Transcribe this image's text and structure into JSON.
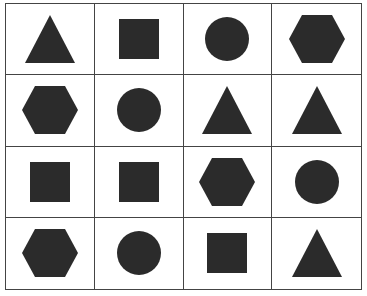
{
  "grid": {
    "rows": 4,
    "cols": 4,
    "fill_color": "#2b2b2b",
    "line_color": "#444444",
    "cells": [
      [
        "triangle",
        "square",
        "circle",
        "hexagon"
      ],
      [
        "hexagon",
        "circle",
        "triangle",
        "triangle"
      ],
      [
        "square",
        "square",
        "hexagon",
        "circle"
      ],
      [
        "hexagon",
        "circle",
        "square",
        "triangle"
      ]
    ]
  }
}
